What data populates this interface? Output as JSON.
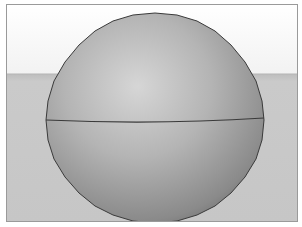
{
  "scene": {
    "type": "3d-viewport",
    "object": "sphere",
    "colors": {
      "sky": "#f7f7f7",
      "ground": "#c9c9c9",
      "horizon_line": "#b8b8b8",
      "border": "#9a9a9a",
      "sphere_light": "#d8d8d8",
      "sphere_mid": "#a8a8a8",
      "sphere_dark": "#6e6e6e",
      "edge": "#3a3a3a"
    }
  }
}
